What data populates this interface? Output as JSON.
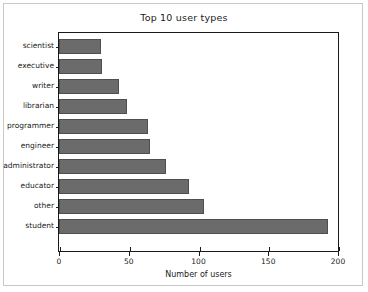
{
  "chart_data": {
    "type": "bar",
    "orientation": "horizontal",
    "title": "Top 10 user types",
    "xlabel": "Number of users",
    "ylabel": "",
    "categories": [
      "scientist",
      "executive",
      "writer",
      "librarian",
      "programmer",
      "engineer",
      "administrator",
      "educator",
      "other",
      "student"
    ],
    "values": [
      30,
      31,
      43,
      49,
      64,
      65,
      77,
      93,
      104,
      193
    ],
    "xlim": [
      0,
      200
    ],
    "xticks": [
      0,
      50,
      100,
      150,
      200
    ],
    "xtick_labels": [
      "0",
      "50",
      "100",
      "150",
      "200"
    ],
    "grid": false,
    "legend": null,
    "bar_color": "#6b6b6b",
    "bar_edge_color": "#4f4f4f",
    "axes_color": "#1a1a1a",
    "background": "#ffffff"
  }
}
